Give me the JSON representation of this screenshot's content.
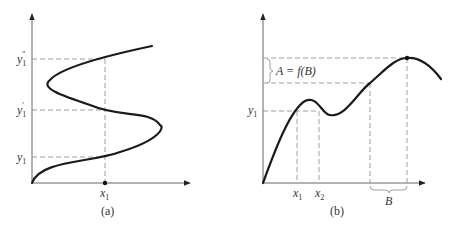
{
  "figure_a": {
    "caption": "(a)",
    "x_label": "x",
    "x_label_sub": "1",
    "y_labels": [
      {
        "base": "y",
        "sub": "1",
        "prime": "″"
      },
      {
        "base": "y",
        "sub": "1",
        "prime": "′"
      },
      {
        "base": "y",
        "sub": "1",
        "prime": ""
      }
    ]
  },
  "figure_b": {
    "caption": "(b)",
    "annotation": "A = f(B)",
    "y_label": "y",
    "y_label_sub": "1",
    "x_labels": [
      {
        "base": "x",
        "sub": "1"
      },
      {
        "base": "x",
        "sub": "2"
      }
    ],
    "bracket_label": "B"
  },
  "colors": {
    "curve": "#1a1a1a",
    "axis": "#666666",
    "dashed": "#888888",
    "text": "#333333"
  }
}
